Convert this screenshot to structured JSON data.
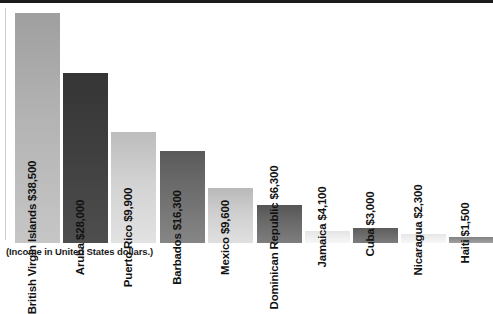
{
  "caption": "(Income in United States dollars.)",
  "chart_data": {
    "type": "bar",
    "title": "",
    "subtitle": "",
    "xlabel": "",
    "ylabel": "",
    "ylim": [
      0,
      38500
    ],
    "grid": false,
    "legend": null,
    "annotations": [
      "(Income in United States dollars.)"
    ],
    "unit": "US dollars",
    "categories": [
      "British Virgin Islands",
      "Aruba",
      "Puerto Rico",
      "Barbados",
      "Mexico",
      "Dominican Republic",
      "Jamaica",
      "Cuba",
      "Nicaragua",
      "Haiti"
    ],
    "values": [
      38500,
      28000,
      9900,
      16300,
      9600,
      6300,
      4100,
      3000,
      2300,
      1500
    ],
    "value_labels": [
      "$38,500",
      "$28,000",
      "$9,900",
      "$16,300",
      "$9,600",
      "$6,300",
      "$4,100",
      "$3,000",
      "$2,300",
      "$1,500"
    ],
    "bar_labels": [
      "British Virgin Islands $38,500",
      "Aruba $28,000",
      "Puerto Rico $9,900",
      "Barbados $16,300",
      "Mexico $9,600",
      "Dominican Republic $6,300",
      "Jamaica $4,100",
      "Cuba $3,000",
      "Nicaragua $2,300",
      "Haiti $1,500"
    ],
    "bar_fills": [
      "#b3b3b3",
      "#3f3f3f",
      "#d2d2d2",
      "#6e6e6e",
      "#cfcfcf",
      "#6a6a6a",
      "#eeeeee",
      "#6b6b6b",
      "#efefef",
      "#8f8f8f"
    ],
    "bar_fills_top": [
      "#9f9f9f",
      "#353535",
      "#bdbdbd",
      "#5a5a5a",
      "#b9b9b9",
      "#565656",
      "#e4e4e4",
      "#5c5c5c",
      "#e6e6e6",
      "#828282"
    ],
    "bar_fills_bottom": [
      "#c6c6c6",
      "#4e4e4e",
      "#e2e2e2",
      "#868686",
      "#e0e0e0",
      "#7e7e7e",
      "#f6f6f6",
      "#7c7c7c",
      "#f7f7f7",
      "#a3a3a3"
    ],
    "bar_geometry": [
      {
        "x": 15,
        "width": 45,
        "top": 13,
        "height": 230,
        "label_outside": false
      },
      {
        "x": 63,
        "width": 45,
        "top": 73,
        "height": 170,
        "label_outside": false
      },
      {
        "x": 111,
        "width": 45,
        "top": 132,
        "height": 111,
        "label_outside": false
      },
      {
        "x": 160,
        "width": 45,
        "top": 151,
        "height": 92,
        "label_outside": false
      },
      {
        "x": 208,
        "width": 45,
        "top": 188,
        "height": 55,
        "label_outside": false
      },
      {
        "x": 257,
        "width": 45,
        "top": 205,
        "height": 38,
        "label_outside": false
      },
      {
        "x": 305,
        "width": 45,
        "top": 231,
        "height": 12,
        "label_outside": true
      },
      {
        "x": 353,
        "width": 45,
        "top": 228,
        "height": 15,
        "label_outside": true
      },
      {
        "x": 401,
        "width": 45,
        "top": 234,
        "height": 9,
        "label_outside": true
      },
      {
        "x": 449,
        "width": 44,
        "top": 237,
        "height": 6,
        "label_outside": true
      }
    ]
  }
}
